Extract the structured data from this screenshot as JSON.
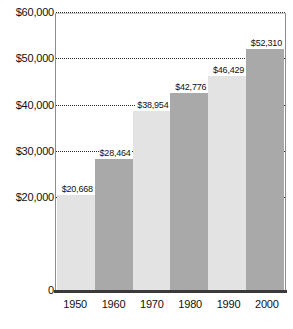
{
  "chart_data": {
    "type": "bar",
    "title": "",
    "subtitle": "",
    "xlabel": "",
    "ylabel": "",
    "categories": [
      "1950",
      "1960",
      "1970",
      "1980",
      "1990",
      "2000"
    ],
    "values": [
      20668,
      28464,
      38954,
      42776,
      46429,
      52310
    ],
    "value_labels": [
      "$20,668",
      "$28,464",
      "$38,954",
      "$42,776",
      "$46,429",
      "$52,310"
    ],
    "bar_colors": [
      "#e3e3e3",
      "#a9a9a9",
      "#e3e3e3",
      "#a9a9a9",
      "#e3e3e3",
      "#a9a9a9"
    ],
    "ylim": [
      0,
      60000
    ],
    "y_ticks": [
      0,
      10000,
      20000,
      30000,
      40000,
      50000,
      60000
    ],
    "y_tick_labels": [
      "0",
      "",
      "$20,000",
      "$30,000",
      "$40,000",
      "$50,000",
      "$60,000"
    ],
    "y_visible_tick_labels": [
      "$60,000",
      "$50,000",
      "$40,000",
      "$30,000",
      "$20,000",
      "0"
    ],
    "gridlines": [
      20000,
      30000,
      40000,
      50000,
      60000
    ],
    "grid": true,
    "grid_style": "dotted",
    "legend": "none",
    "legend_position": "none",
    "bar_gap": 0
  },
  "caption": {
    "remnant": ""
  }
}
